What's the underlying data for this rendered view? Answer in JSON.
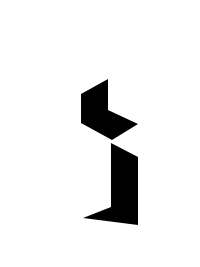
{
  "figure": {
    "background": "#ffffff",
    "fill": "#000000",
    "shapes": [
      {
        "name": "upper-chevron-shape",
        "points": "108,79 81,94 81,123 112,140 138,124 108,110"
      },
      {
        "name": "lower-hook-shape",
        "points": "111,143 138,157 138,225 83,218 111,207"
      }
    ]
  }
}
